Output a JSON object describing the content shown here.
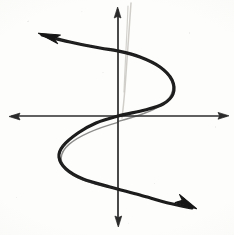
{
  "figure": {
    "caption": "",
    "background_color": "#fdfdfb",
    "ink_color": "#1a1a1a",
    "axis_color": "#2b2b2b",
    "stray_mark_color": "#c9c7c2",
    "media": "pencil-on-paper-scan"
  },
  "chart_data": {
    "type": "line",
    "title": "",
    "xlabel": "",
    "ylabel": "",
    "grid": false,
    "legend": null,
    "xlim": [
      -117,
      117
    ],
    "ylim": [
      -119,
      116
    ],
    "origin_px": [
      118,
      116
    ],
    "axes": {
      "x_axis": {
        "label": "",
        "from_px": [
          10,
          116
        ],
        "to_px": [
          228,
          116
        ],
        "arrow_start": true,
        "arrow_end": true
      },
      "y_axis": {
        "label": "",
        "from_px": [
          118,
          8
        ],
        "to_px": [
          118,
          226
        ],
        "arrow_start": true,
        "arrow_end": true
      }
    },
    "series": [
      {
        "name": "sideways-cubic",
        "description": "Rotated cubic: x plotted as a function of y; S-shape opening left at top and right at bottom",
        "stroke_width_px": 3.2,
        "color": "#1a1a1a",
        "arrow_start": true,
        "arrow_end": true,
        "points_px": [
          [
            42,
            35
          ],
          [
            70,
            42
          ],
          [
            100,
            48
          ],
          [
            118,
            51
          ],
          [
            140,
            57
          ],
          [
            160,
            67
          ],
          [
            172,
            80
          ],
          [
            173,
            94
          ],
          [
            163,
            104
          ],
          [
            145,
            110
          ],
          [
            118,
            116
          ],
          [
            96,
            123
          ],
          [
            78,
            133
          ],
          [
            63,
            146
          ],
          [
            59,
            157
          ],
          [
            66,
            169
          ],
          [
            83,
            179
          ],
          [
            110,
            187
          ],
          [
            140,
            195
          ],
          [
            168,
            203
          ],
          [
            192,
            208
          ]
        ],
        "extrema_px": [
          {
            "kind": "rightmost-turn",
            "at": [
              173,
              84
            ]
          },
          {
            "kind": "leftmost-turn",
            "at": [
              59,
              155
            ]
          }
        ],
        "intercepts_px": [
          {
            "kind": "origin-crossing",
            "at": [
              118,
              116
            ]
          },
          {
            "kind": "y-axis-upper",
            "at": [
              118,
              51
            ]
          },
          {
            "kind": "y-axis-lower",
            "at": [
              118,
              189
            ]
          }
        ]
      }
    ],
    "annotations": [
      {
        "name": "stray-pencil-line",
        "description": "faint light-gray stray stroke to the right of the y-axis, fading downward",
        "from_px": [
          131,
          3
        ],
        "to_px": [
          122,
          118
        ],
        "color": "#c9c7c2"
      }
    ]
  }
}
